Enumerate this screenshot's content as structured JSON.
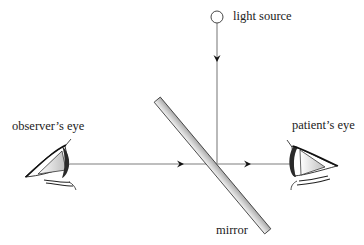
{
  "diagram": {
    "labels": {
      "light_source": "light source",
      "observer_eye": "observer’s eye",
      "patient_eye": "patient’s eye",
      "mirror": "mirror"
    },
    "colors": {
      "beam": "#a8a8a8",
      "arrow": "#111111",
      "mirror_fill": "#d4d4d4",
      "mirror_edge": "#333333",
      "text": "#222222"
    }
  }
}
